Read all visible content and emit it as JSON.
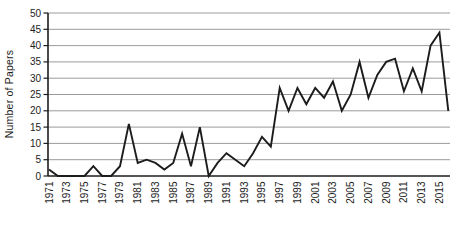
{
  "chart_data": {
    "type": "line",
    "title": "",
    "xlabel": "",
    "ylabel": "Number of Papers",
    "x": [
      1971,
      1972,
      1973,
      1974,
      1975,
      1976,
      1977,
      1978,
      1979,
      1980,
      1981,
      1982,
      1983,
      1984,
      1985,
      1986,
      1987,
      1988,
      1989,
      1990,
      1991,
      1992,
      1993,
      1994,
      1995,
      1996,
      1997,
      1998,
      1999,
      2000,
      2001,
      2002,
      2003,
      2004,
      2005,
      2006,
      2007,
      2008,
      2009,
      2010,
      2011,
      2012,
      2013,
      2014,
      2015,
      2016
    ],
    "series": [
      {
        "name": "Number of Papers",
        "values": [
          2,
          0,
          0,
          0,
          0,
          3,
          0,
          0,
          3,
          16,
          4,
          5,
          4,
          2,
          4,
          13,
          3,
          15,
          0,
          4,
          7,
          5,
          3,
          7,
          12,
          9,
          27,
          20,
          27,
          22,
          27,
          24,
          29,
          20,
          25,
          35,
          24,
          31,
          35,
          36,
          26,
          33,
          26,
          40,
          44,
          20
        ]
      }
    ],
    "ylim": [
      0,
      50
    ],
    "ytick_step": 5,
    "ytick_labels": [
      "0",
      "5",
      "10",
      "15",
      "20",
      "25",
      "30",
      "35",
      "40",
      "45",
      "50"
    ],
    "xtick_labels": [
      "1971",
      "1973",
      "1975",
      "1977",
      "1979",
      "1981",
      "1983",
      "1985",
      "1987",
      "1989",
      "1991",
      "1993",
      "1995",
      "1997",
      "1999",
      "2001",
      "2003",
      "2005",
      "2007",
      "2009",
      "2011",
      "2013",
      "2015"
    ],
    "grid": "horizontal",
    "legend": "none",
    "line_color": "#1c1c1c",
    "grid_color": "#9b9b9b",
    "axis_color": "#1c1c1c",
    "tick_label_color": "#1c1c1c",
    "background": "#ffffff"
  }
}
